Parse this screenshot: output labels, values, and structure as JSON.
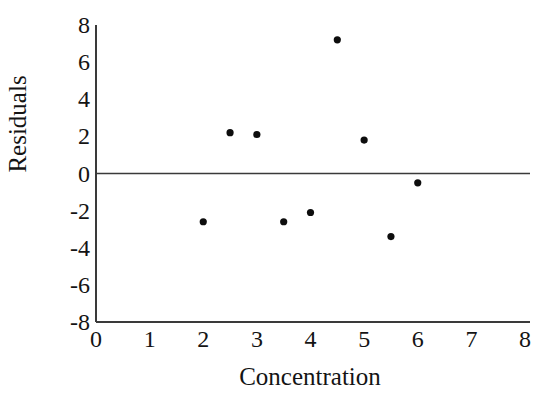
{
  "chart_data": {
    "type": "scatter",
    "title": "",
    "xlabel": "Concentration",
    "ylabel": "Residuals",
    "xlim": [
      0,
      8
    ],
    "ylim": [
      -8,
      8
    ],
    "xticks": [
      "0",
      "1",
      "2",
      "3",
      "4",
      "5",
      "6",
      "7",
      "8"
    ],
    "xtick_values": [
      0,
      1,
      2,
      3,
      4,
      5,
      6,
      7,
      8
    ],
    "yticks": [
      "8",
      "6",
      "4",
      "2",
      "0",
      "-2",
      "-4",
      "-6",
      "-8"
    ],
    "ytick_values": [
      8,
      6,
      4,
      2,
      0,
      -2,
      -4,
      -6,
      -8
    ],
    "grid": false,
    "legend": null,
    "zero_reference_line": 0,
    "marker": "filled-circle",
    "marker_color": "#0d0d0d",
    "axis_color": "#3a3a3a",
    "x": [
      2.0,
      2.5,
      3.0,
      3.5,
      4.0,
      4.5,
      5.0,
      5.5,
      6.0
    ],
    "y": [
      -2.6,
      2.2,
      2.1,
      -2.6,
      -2.1,
      7.2,
      1.8,
      -3.4,
      -0.5
    ],
    "points": [
      {
        "x": 2.0,
        "y": -2.6
      },
      {
        "x": 2.5,
        "y": 2.2
      },
      {
        "x": 3.0,
        "y": 2.1
      },
      {
        "x": 3.5,
        "y": -2.6
      },
      {
        "x": 4.0,
        "y": -2.1
      },
      {
        "x": 4.5,
        "y": 7.2
      },
      {
        "x": 5.0,
        "y": 1.8
      },
      {
        "x": 5.5,
        "y": -3.4
      },
      {
        "x": 6.0,
        "y": -0.5
      }
    ]
  }
}
